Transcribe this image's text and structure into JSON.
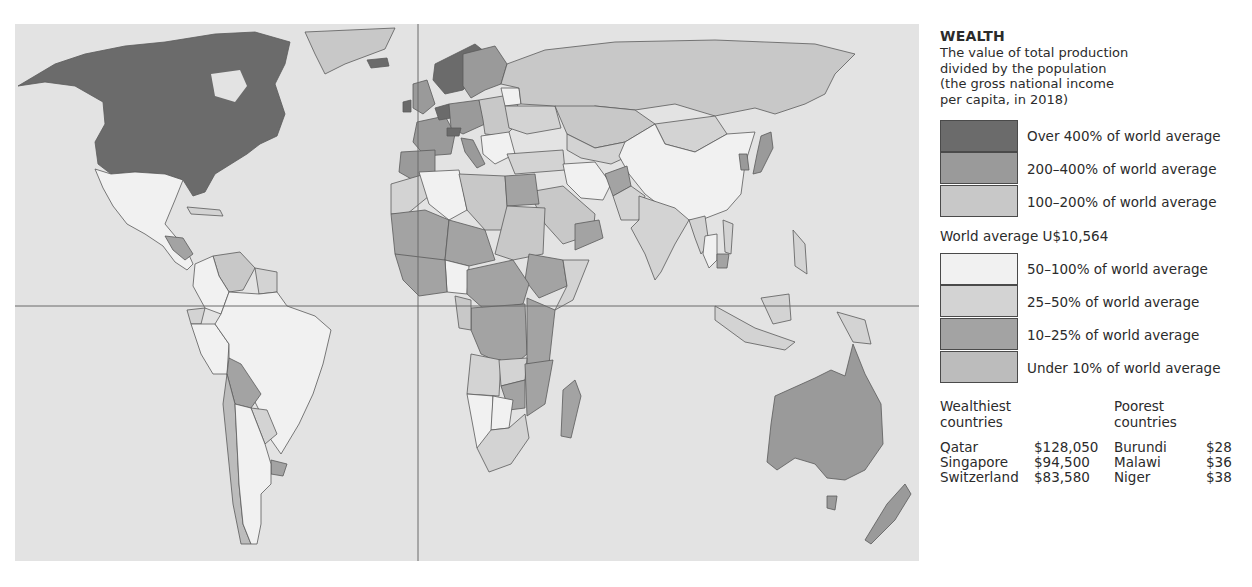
{
  "legend": {
    "title": "WEALTH",
    "description": [
      "The value of total production",
      "divided by the population",
      "(the gross national income",
      "per capita, in 2018)"
    ],
    "upper_categories": [
      {
        "label": "Over 400% of world average",
        "color": "#6b6b6b"
      },
      {
        "label": "200–400% of world average",
        "color": "#9a9a9a"
      },
      {
        "label": "100–200% of world average",
        "color": "#c8c8c8"
      }
    ],
    "world_average": "World average U$10,564",
    "lower_categories": [
      {
        "label": "50–100% of world average",
        "color": "#f1f1f1"
      },
      {
        "label": "25–50% of world average",
        "color": "#d3d3d3"
      },
      {
        "label": "10–25% of world average",
        "color": "#a3a3a3"
      },
      {
        "label": "Under 10% of world average",
        "color": "#bcbcbc"
      }
    ]
  },
  "wealthiest": {
    "heading_line1": "Wealthiest",
    "heading_line2": "countries",
    "rows": [
      {
        "country": "Qatar",
        "value": "$128,050"
      },
      {
        "country": "Singapore",
        "value": "$94,500"
      },
      {
        "country": "Switzerland",
        "value": "$83,580"
      }
    ]
  },
  "poorest": {
    "heading_line1": "Poorest",
    "heading_line2": "countries",
    "rows": [
      {
        "country": "Burundi",
        "value": "$28"
      },
      {
        "country": "Malawi",
        "value": "$36"
      },
      {
        "country": "Niger",
        "value": "$38"
      }
    ]
  },
  "map": {
    "ocean_color": "#e3e3e3",
    "border_color": "#5a5a5a"
  }
}
